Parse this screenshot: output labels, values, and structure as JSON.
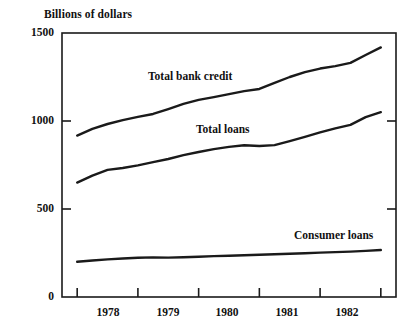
{
  "chart_data": {
    "type": "line",
    "title": "Billions of dollars",
    "xlabel": "",
    "ylabel": "Billions of dollars",
    "ylim": [
      0,
      1500
    ],
    "yticks": [
      0,
      500,
      1000,
      1500
    ],
    "ytick_labels": [
      "0",
      "500",
      "1000",
      "1500"
    ],
    "xlim": [
      1977.5,
      1983.0
    ],
    "xtick_labels": [
      "1978",
      "1979",
      "1980",
      "1981",
      "1982"
    ],
    "grid": false,
    "legend": "inline-annotations",
    "x": [
      1977.75,
      1978.0,
      1978.25,
      1978.5,
      1978.75,
      1979.0,
      1979.25,
      1979.5,
      1979.75,
      1980.0,
      1980.25,
      1980.5,
      1980.75,
      1981.0,
      1981.25,
      1981.5,
      1981.75,
      1982.0,
      1982.25,
      1982.5,
      1982.75
    ],
    "series": [
      {
        "name": "Total bank credit",
        "label_text": "Total bank credit",
        "values": [
          917,
          955,
          983,
          1005,
          1023,
          1040,
          1068,
          1097,
          1120,
          1136,
          1153,
          1170,
          1182,
          1216,
          1250,
          1278,
          1298,
          1312,
          1330,
          1375,
          1418
        ]
      },
      {
        "name": "Total loans",
        "label_text": "Total loans",
        "values": [
          650,
          690,
          722,
          733,
          748,
          766,
          784,
          806,
          824,
          840,
          853,
          862,
          858,
          863,
          886,
          910,
          935,
          958,
          978,
          1022,
          1050
        ]
      },
      {
        "name": "Consumer loans",
        "label_text": "Consumer loans",
        "values": [
          200,
          207,
          214,
          219,
          223,
          225,
          224,
          226,
          229,
          232,
          234,
          237,
          240,
          243,
          246,
          249,
          252,
          255,
          258,
          262,
          267
        ]
      }
    ],
    "annotations": [
      {
        "text": "Total bank credit",
        "x": 148,
        "y": 70
      },
      {
        "text": "Total loans",
        "x": 196,
        "y": 123
      },
      {
        "text": "Consumer loans",
        "x": 294,
        "y": 229
      }
    ],
    "colors": {
      "line": "#1a1a1a",
      "axis": "#1a1a1a",
      "background": "#ffffff"
    }
  }
}
